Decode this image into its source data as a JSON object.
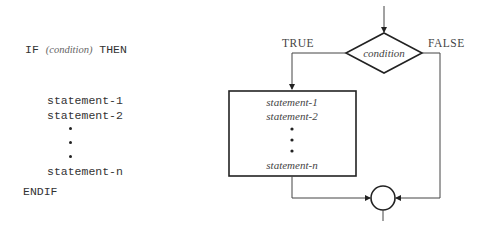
{
  "pseudocode": {
    "if_keyword": "IF",
    "condition": "(condition)",
    "then_keyword": "THEN",
    "statements": [
      "statement-1",
      "statement-2",
      "statement-n"
    ],
    "endif_keyword": "ENDIF"
  },
  "flowchart": {
    "decision_label": "condition",
    "true_label": "TRUE",
    "false_label": "FALSE",
    "process_statements": [
      "statement-1",
      "statement-2",
      "statement-n"
    ]
  }
}
